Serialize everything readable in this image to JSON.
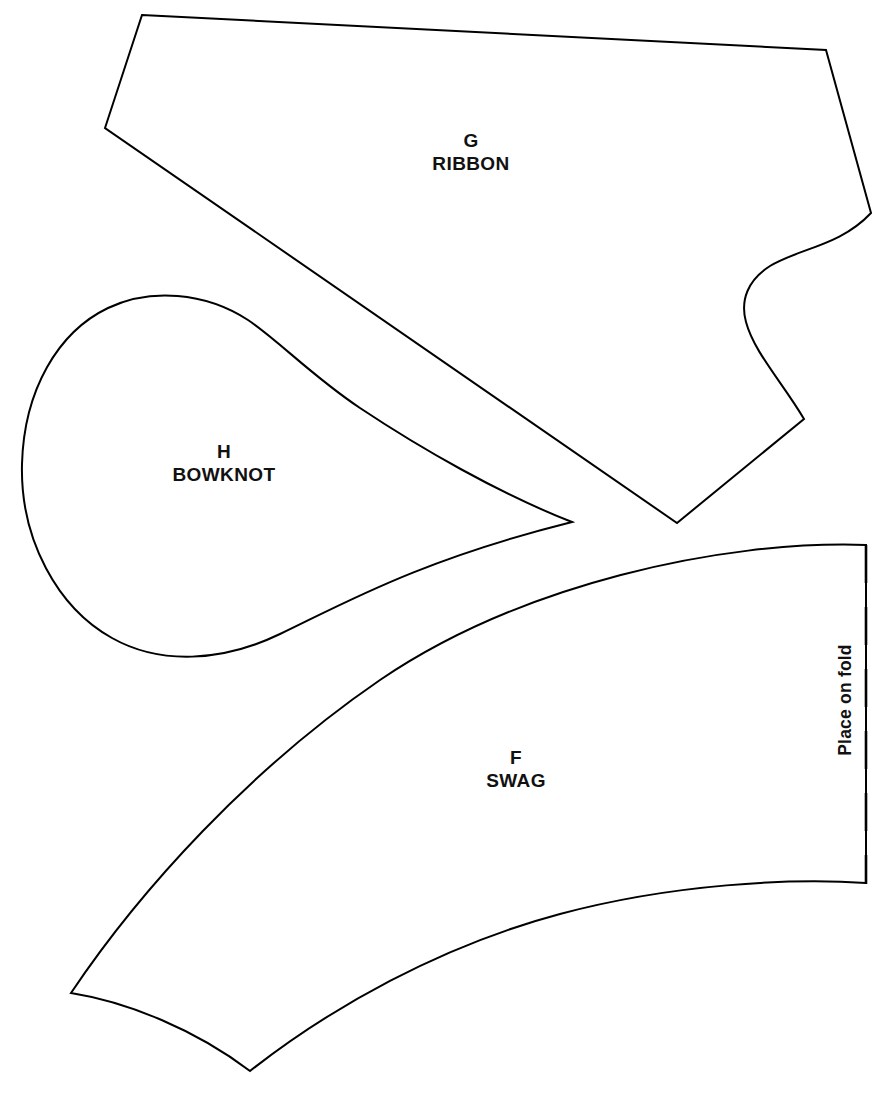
{
  "sheet": {
    "title": "Sewing pattern sheet",
    "background_color": "#ffffff",
    "line_color": "#000000",
    "width": 888,
    "height": 1101
  },
  "pieces": [
    {
      "id": "ribbon",
      "letter": "G",
      "name": "RIBBON",
      "label_x": 471,
      "label_y": 152
    },
    {
      "id": "bowknot",
      "letter": "H",
      "name": "BOWKNOT",
      "label_x": 224,
      "label_y": 463
    },
    {
      "id": "swag",
      "letter": "F",
      "name": "SWAG",
      "label_x": 516,
      "label_y": 769
    }
  ],
  "fold": {
    "label": "Place on fold",
    "orientation": "vertical",
    "line_style": "dashed",
    "x": 866,
    "y_start": 545,
    "y_end": 884
  }
}
